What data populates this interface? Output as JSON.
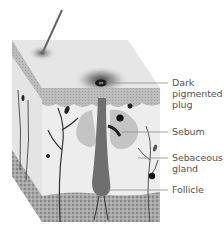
{
  "diagram": {
    "labels": [
      {
        "id": "plug",
        "text": "Dark pigmented plug",
        "lines": [
          "Dark",
          "pigmented",
          "plug"
        ]
      },
      {
        "id": "sebum",
        "text": "Sebum",
        "lines": [
          "Sebum"
        ]
      },
      {
        "id": "gland",
        "text": "Sebaceous gland",
        "lines": [
          "Sebaceous",
          "gland"
        ]
      },
      {
        "id": "follicle",
        "text": "Follicle",
        "lines": [
          "Follicle"
        ]
      }
    ]
  },
  "colors": {
    "surface": "#e6e6e6",
    "epidermis": "#b9b9b9",
    "dermis": "#ececec",
    "fat": "#9a9a9a",
    "follicle": "#6f6f6f",
    "plug": "#1a1a1a",
    "leader_line": "#8a8a8a",
    "label_text": "#555555"
  }
}
